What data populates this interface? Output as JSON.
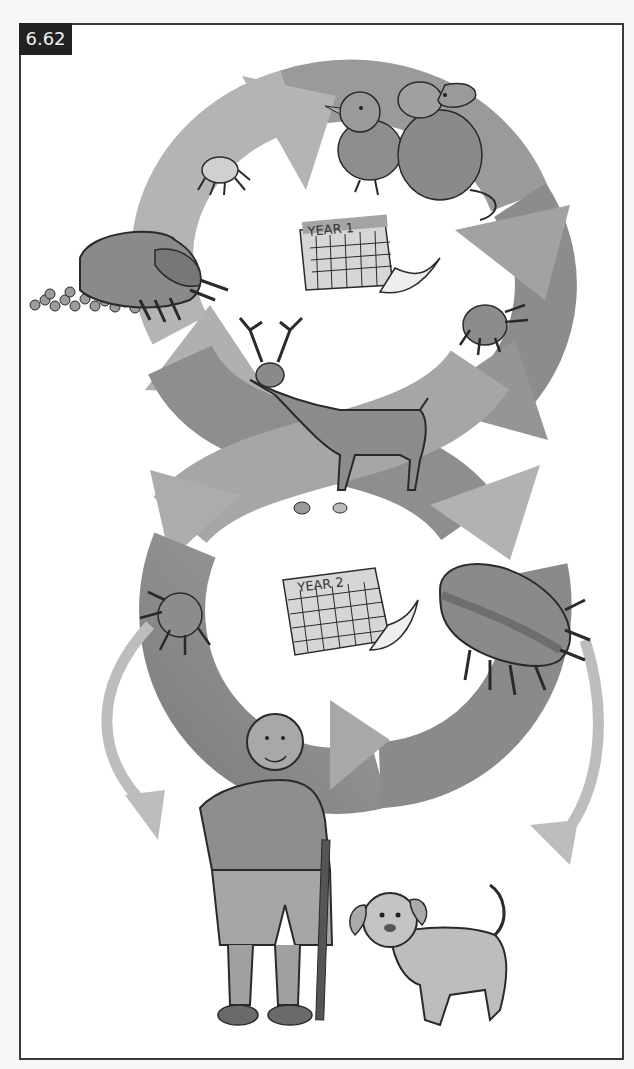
{
  "figure": {
    "label": "6.62",
    "type": "illustration",
    "palette": {
      "frame": "#3a3a3a",
      "label_bg": "#222222",
      "label_text": "#f0f0f0",
      "arrow_light": "#b4b4b4",
      "arrow_mid": "#9a9a9a",
      "arrow_dark": "#7e7e7e",
      "outline": "#2a2a2a",
      "animal_fill": "#a6a6a6",
      "animal_dark": "#8a8a8a"
    }
  },
  "calendars": [
    {
      "label": "YEAR 1",
      "position": "upper-loop-center"
    },
    {
      "label": "YEAR 2",
      "position": "lower-loop-center"
    }
  ],
  "cycle_elements": [
    {
      "name": "tick-eggs",
      "desc": "engorged female tick laying eggs",
      "position": "upper-left"
    },
    {
      "name": "larva",
      "desc": "small six-legged larva",
      "position": "upper-left-arrow"
    },
    {
      "name": "small-hosts-bird-mouse",
      "desc": "bird and mouse",
      "position": "top"
    },
    {
      "name": "nymph-year1",
      "desc": "nymph tick",
      "position": "right-upper"
    },
    {
      "name": "deer",
      "desc": "deer with small mouse and bird at its feet",
      "position": "center-crossing"
    },
    {
      "name": "nymph-year2",
      "desc": "nymph tick",
      "position": "left-lower"
    },
    {
      "name": "adult-engorged",
      "desc": "engorged adult tick",
      "position": "right-lower"
    },
    {
      "name": "human",
      "desc": "bald man with walking stick",
      "position": "bottom-left"
    },
    {
      "name": "dog",
      "desc": "dog",
      "position": "bottom-right"
    }
  ]
}
